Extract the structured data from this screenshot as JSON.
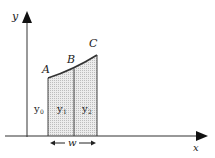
{
  "diagram": {
    "axes": {
      "x_label": "x",
      "y_label": "y"
    },
    "points": [
      {
        "label": "A"
      },
      {
        "label": "B"
      },
      {
        "label": "C"
      }
    ],
    "strips": [
      {
        "label": "y",
        "subscript": "0"
      },
      {
        "label": "y",
        "subscript": "1"
      },
      {
        "label": "y",
        "subscript": "2"
      }
    ],
    "width_label": "w",
    "colors": {
      "line": "#333333",
      "shading": "#d9d9d9"
    }
  }
}
